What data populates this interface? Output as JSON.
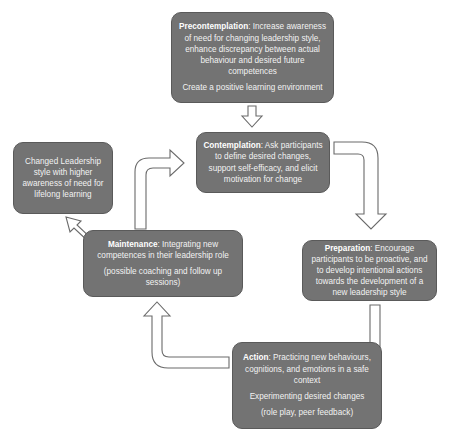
{
  "diagram": {
    "type": "cycle",
    "stages": [
      {
        "id": "precontemplation",
        "title": "Precontemplation",
        "text": ": Increase awareness of need for changing leadership style, enhance discrepancy between actual behaviour and desired future competences",
        "note": "Create a positive learning environment"
      },
      {
        "id": "contemplation",
        "title": "Contemplation",
        "text": ": Ask participants to define desired changes, support self-efficacy, and elicit motivation for change"
      },
      {
        "id": "preparation",
        "title": "Preparation",
        "text": ": Encourage participants to be proactive, and to develop intentional actions towards the development of a new leadership style"
      },
      {
        "id": "action",
        "title": "Action",
        "text": ": Practicing new behaviours, cognitions, and emotions in a safe context",
        "note": "Experimenting desired changes",
        "note2": "(role play, peer feedback)"
      },
      {
        "id": "maintenance",
        "title": "Maintenance",
        "text": ": Integrating new competences in their leadership role",
        "note": "(possible coaching and follow up sessions)"
      }
    ],
    "outcome": {
      "id": "changed-leadership",
      "text": "Changed Leadership style with higher awareness of need for lifelong learning"
    },
    "edges": [
      {
        "from": "precontemplation",
        "to": "contemplation"
      },
      {
        "from": "contemplation",
        "to": "preparation"
      },
      {
        "from": "preparation",
        "to": "action"
      },
      {
        "from": "action",
        "to": "maintenance"
      },
      {
        "from": "maintenance",
        "to": "contemplation"
      },
      {
        "from": "maintenance",
        "to": "changed-leadership"
      }
    ],
    "colors": {
      "box_fill": "#737373",
      "box_text": "#f2f2f2",
      "arrow_fill": "#ffffff",
      "arrow_stroke": "#6a6a6a"
    }
  }
}
